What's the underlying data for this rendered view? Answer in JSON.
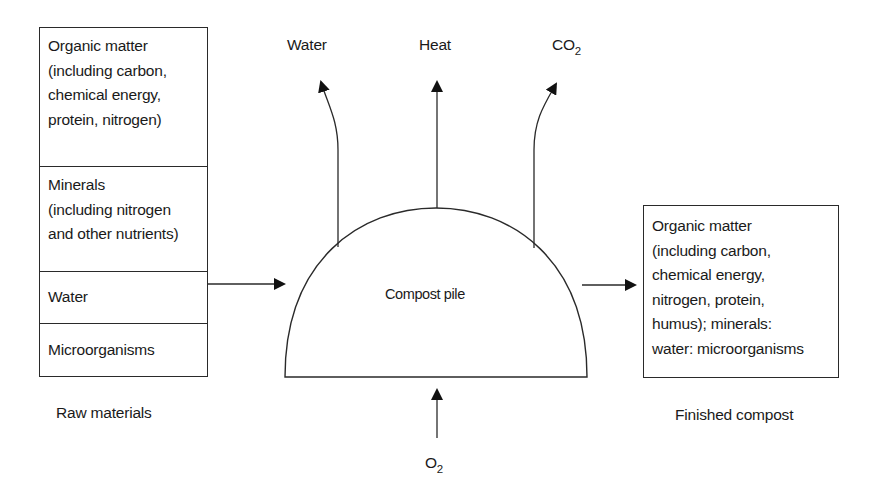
{
  "raw_materials": {
    "caption": "Raw materials",
    "items": [
      {
        "text": "Organic matter\n(including carbon,\nchemical energy,\nprotein, nitrogen)"
      },
      {
        "text": "Minerals\n(including nitrogen\nand other nutrients)"
      },
      {
        "text": "Water"
      },
      {
        "text": "Microorganisms"
      }
    ]
  },
  "compost_pile": {
    "label": "Compost pile"
  },
  "outputs": {
    "water": "Water",
    "heat": "Heat",
    "co2_main": "CO",
    "co2_sub": "2"
  },
  "inputs": {
    "o2_main": "O",
    "o2_sub": "2"
  },
  "finished_compost": {
    "caption": "Finished compost",
    "text": "Organic matter\n(including carbon,\nchemical energy,\nnitrogen, protein,\nhumus); minerals:\nwater: microorganisms"
  }
}
